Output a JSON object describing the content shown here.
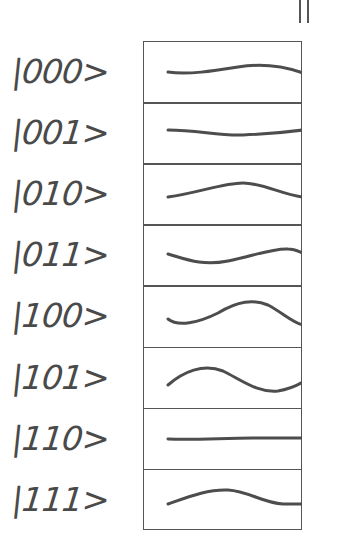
{
  "diagram": {
    "top_marker": "||",
    "stroke_color": "#4d4d4d",
    "border_color": "#555555",
    "states": [
      {
        "label": "|000>",
        "wave": "M25 31 C45 34 70 30 95 26 C120 22 140 25 160 32"
      },
      {
        "label": "|001>",
        "wave": "M25 28 C55 28 75 34 100 33 C125 32 145 30 160 28"
      },
      {
        "label": "|010>",
        "wave": "M25 34 C55 30 80 20 100 20 C120 20 140 32 160 34"
      },
      {
        "label": "|011>",
        "wave": "M25 30 C45 36 60 42 85 37 C110 32 130 24 145 25 C152 25 157 28 160 29"
      },
      {
        "label": "|100>",
        "wave": "M25 34 C35 42 55 38 75 28 C95 16 110 14 125 20 C140 28 150 38 160 40"
      },
      {
        "label": "|101>",
        "wave": "M25 38 C40 25 60 16 80 24 C100 34 115 46 135 44 C148 42 155 38 160 35"
      },
      {
        "label": "|110>",
        "wave": "M25 31 C55 32 80 30 110 30 C135 30 150 30 160 30"
      },
      {
        "label": "|111>",
        "wave": "M25 35 C45 28 65 20 85 21 C105 22 120 34 140 35 C150 35 156 35 160 35"
      }
    ]
  }
}
